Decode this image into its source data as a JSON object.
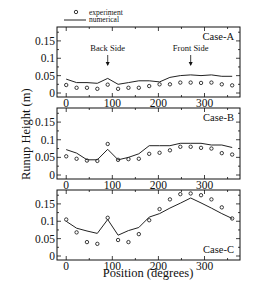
{
  "chart_data": [
    {
      "type": "line",
      "panel": "Case-A",
      "title": "Case-A",
      "xlabel": "Position (degrees)",
      "ylabel": "Runup Height (m)",
      "xlim": [
        -20,
        377
      ],
      "ylim": [
        0,
        0.19
      ],
      "x_ticks": [
        0,
        100,
        200,
        300
      ],
      "y_ticks": [
        0,
        0.05,
        0.1,
        0.15
      ],
      "y_tick_labels": [
        "0",
        "0.05",
        "0.1",
        "0.15"
      ],
      "x": [
        0,
        22.5,
        45,
        67.5,
        90,
        112.5,
        135,
        157.5,
        180,
        202.5,
        225,
        247.5,
        270,
        292.5,
        315,
        337.5,
        360
      ],
      "series": [
        {
          "name": "experiment",
          "style": "markers",
          "values": [
            0.023,
            0.015,
            0.015,
            0.012,
            0.024,
            0.012,
            0.015,
            0.015,
            0.02,
            0.025,
            0.025,
            0.03,
            0.03,
            0.029,
            0.03,
            0.025,
            0.022
          ]
        },
        {
          "name": "numerical",
          "style": "line",
          "values": [
            0.04,
            0.03,
            0.03,
            0.028,
            0.042,
            0.025,
            0.03,
            0.035,
            0.035,
            0.032,
            0.045,
            0.05,
            0.052,
            0.05,
            0.052,
            0.048,
            0.048
          ]
        }
      ],
      "annotations": [
        {
          "text": "Back Side",
          "x": 90,
          "arrow": "down"
        },
        {
          "text": "Front Side",
          "x": 270,
          "arrow": "down"
        }
      ]
    },
    {
      "type": "line",
      "panel": "Case-B",
      "title": "Case-B",
      "xlabel": "Position (degrees)",
      "ylabel": "Runup Height (m)",
      "xlim": [
        -20,
        377
      ],
      "ylim": [
        0,
        0.19
      ],
      "x_ticks": [
        0,
        100,
        200,
        300
      ],
      "y_ticks": [
        0,
        0.05,
        0.1,
        0.15
      ],
      "y_tick_labels": [
        "0",
        "0.05",
        "0.1",
        "0.15"
      ],
      "x": [
        0,
        22.5,
        45,
        67.5,
        90,
        112.5,
        135,
        157.5,
        180,
        202.5,
        225,
        247.5,
        270,
        292.5,
        315,
        337.5,
        360
      ],
      "series": [
        {
          "name": "experiment",
          "style": "markers",
          "values": [
            0.053,
            0.046,
            0.041,
            0.04,
            0.088,
            0.043,
            0.045,
            0.046,
            0.06,
            0.063,
            0.07,
            0.08,
            0.08,
            0.077,
            0.075,
            0.062,
            0.058
          ]
        },
        {
          "name": "numerical",
          "style": "line",
          "values": [
            0.072,
            0.062,
            0.043,
            0.043,
            0.073,
            0.043,
            0.05,
            0.06,
            0.083,
            0.083,
            0.083,
            0.09,
            0.09,
            0.09,
            0.085,
            0.085,
            0.078
          ]
        }
      ],
      "annotations": []
    },
    {
      "type": "line",
      "panel": "Case-C",
      "title": "Case-C",
      "xlabel": "Position (degrees)",
      "ylabel": "Runup Height (m)",
      "xlim": [
        -20,
        377
      ],
      "ylim": [
        0,
        0.19
      ],
      "x_ticks": [
        0,
        100,
        200,
        300
      ],
      "y_ticks": [
        0,
        0.05,
        0.1,
        0.15
      ],
      "y_tick_labels": [
        "0",
        "0.05",
        "0.1",
        "0.15"
      ],
      "x": [
        0,
        22.5,
        45,
        67.5,
        90,
        112.5,
        135,
        157.5,
        180,
        202.5,
        225,
        247.5,
        270,
        292.5,
        315,
        337.5,
        360
      ],
      "series": [
        {
          "name": "experiment",
          "style": "markers",
          "values": [
            0.105,
            0.068,
            0.04,
            0.035,
            0.11,
            0.046,
            0.04,
            0.063,
            0.103,
            0.135,
            0.163,
            0.178,
            0.18,
            0.175,
            0.163,
            0.14,
            0.108
          ]
        },
        {
          "name": "numerical",
          "style": "line",
          "values": [
            0.1,
            0.08,
            0.072,
            0.065,
            0.105,
            0.06,
            0.073,
            0.082,
            0.112,
            0.122,
            0.138,
            0.152,
            0.167,
            0.153,
            0.138,
            0.122,
            0.108
          ]
        }
      ],
      "annotations": []
    }
  ],
  "legend": {
    "placement": "top-left",
    "entries": [
      {
        "label": "experiment",
        "marker": "circle"
      },
      {
        "label": "numerical",
        "marker": "line"
      }
    ]
  },
  "labels": {
    "ylabel": "Runup Height (m)",
    "xlabel": "Position (degrees)"
  }
}
